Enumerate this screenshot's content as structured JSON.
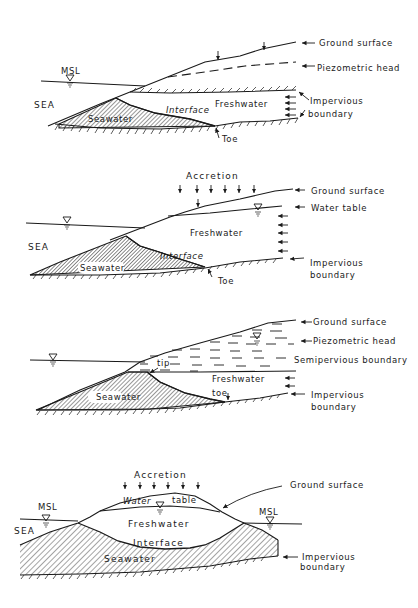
{
  "figure": {
    "panels": [
      {
        "id": "confined-aquifer",
        "labels": {
          "msl": "MSL",
          "sea": "SEA",
          "seawater": "Seawater",
          "interface": "Interface",
          "freshwater": "Freshwater",
          "toe": "Toe",
          "ground_surface": "Ground surface",
          "piezometric_head": "Piezometric head",
          "impervious_1": "Impervious",
          "impervious_2": "boundary"
        }
      },
      {
        "id": "unconfined-aquifer",
        "labels": {
          "accretion": "Accretion",
          "sea": "SEA",
          "seawater": "Seawater",
          "interface": "Interface",
          "freshwater": "Freshwater",
          "toe": "Toe",
          "ground_surface": "Ground surface",
          "water_table": "Water table",
          "impervious_1": "Impervious",
          "impervious_2": "boundary"
        }
      },
      {
        "id": "leaky-aquifer",
        "labels": {
          "tip": "tip",
          "seawater": "Seawater",
          "freshwater": "Freshwater",
          "toe": "toe",
          "ground_surface": "Ground surface",
          "piezometric_head": "Piezometric head",
          "semipervious": "Semipervious boundary",
          "impervious_1": "Impervious",
          "impervious_2": "boundary"
        }
      },
      {
        "id": "oceanic-island",
        "labels": {
          "accretion": "Accretion",
          "msl_left": "MSL",
          "msl_right": "MSL",
          "sea": "SEA",
          "water_table_1": "Water",
          "water_table_2": "table",
          "freshwater": "Freshwater",
          "interface": "Interface",
          "seawater": "Seawater",
          "ground_surface": "Ground surface",
          "impervious_1": "Impervious",
          "impervious_2": "boundary"
        }
      }
    ],
    "colors": {
      "ink": "#1a1a1a",
      "background": "#ffffff"
    }
  }
}
